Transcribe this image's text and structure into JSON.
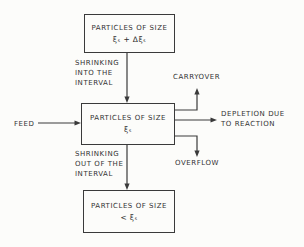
{
  "diagram": {
    "colors": {
      "ink": "#333333",
      "background": "#fcfcfa"
    },
    "boxes": {
      "upper": {
        "line1": "PARTICLES OF SIZE",
        "line2": "ξₛ + Δξₛ"
      },
      "middle": {
        "line1": "PARTICLES OF SIZE",
        "line2": "ξₛ"
      },
      "lower": {
        "line1": "PARTICLES OF SIZE",
        "line2": "< ξₛ"
      }
    },
    "labels": {
      "feed": "FEED",
      "shrinking_into": {
        "l1": "SHRINKING",
        "l2": "INTO THE",
        "l3": "INTERVAL"
      },
      "shrinking_out": {
        "l1": "SHRINKING",
        "l2": "OUT OF THE",
        "l3": "INTERVAL"
      },
      "carryover": "CARRYOVER",
      "depletion": {
        "l1": "DEPLETION DUE",
        "l2": "TO REACTION"
      },
      "overflow": "OVERFLOW"
    }
  }
}
